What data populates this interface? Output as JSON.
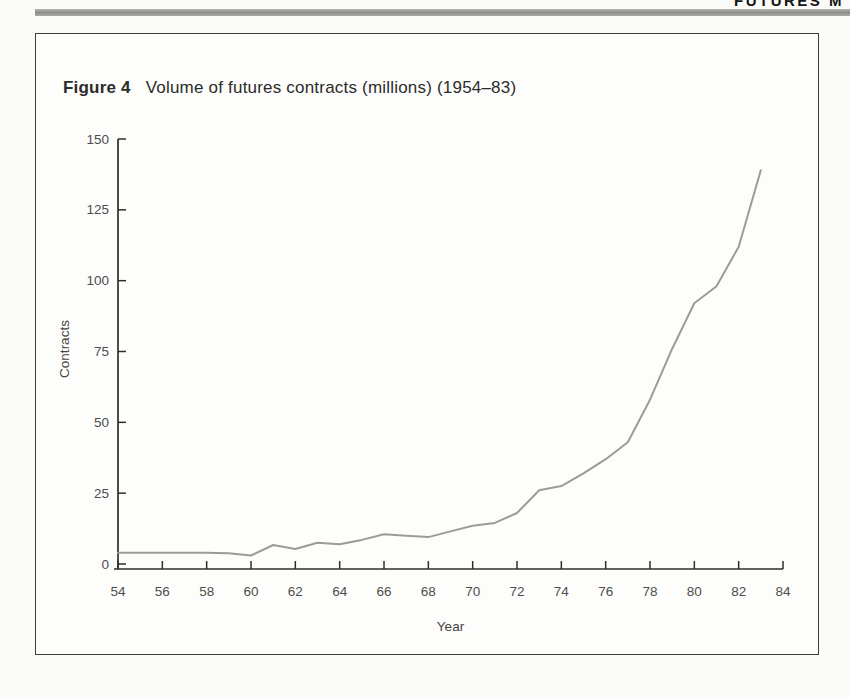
{
  "page": {
    "running_head": "FUTURES M",
    "background": "#fbfbf8"
  },
  "figure": {
    "label": "Figure 4",
    "caption": "Volume of futures contracts (millions) (1954–83)"
  },
  "chart_data": {
    "type": "line",
    "title": "Volume of futures contracts (millions) (1954–83)",
    "xlabel": "Year",
    "ylabel": "Contracts",
    "x": [
      54,
      55,
      56,
      57,
      58,
      59,
      60,
      61,
      62,
      63,
      64,
      65,
      66,
      67,
      68,
      69,
      70,
      71,
      72,
      73,
      74,
      75,
      76,
      77,
      78,
      79,
      80,
      81,
      82,
      83
    ],
    "values": [
      4,
      4,
      4,
      4,
      4,
      3.8,
      3,
      6.7,
      5.3,
      7.5,
      7,
      8.5,
      10.5,
      10,
      9.5,
      11.5,
      13.5,
      14.5,
      18,
      26,
      27.5,
      32,
      37,
      43,
      58,
      76,
      92,
      98,
      112,
      139
    ],
    "x_ticks": [
      54,
      56,
      58,
      60,
      62,
      64,
      66,
      68,
      70,
      72,
      74,
      76,
      78,
      80,
      82,
      84
    ],
    "y_ticks": [
      0,
      25,
      50,
      75,
      100,
      125,
      150
    ],
    "xlim": [
      54,
      84
    ],
    "ylim": [
      0,
      150
    ],
    "grid": false,
    "legend": "none",
    "line_color": "#9b9b99",
    "axis_color": "#2e2e2c"
  }
}
